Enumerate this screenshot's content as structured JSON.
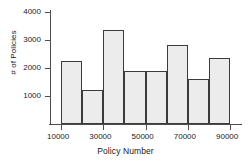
{
  "chart_data": {
    "type": "bar",
    "title": "",
    "xlabel": "Policy Number",
    "ylabel": "# of Policies",
    "categories": [
      "10000-20000",
      "20000-30000",
      "30000-40000",
      "40000-50000",
      "50000-60000",
      "60000-70000",
      "70000-80000",
      "80000-90000"
    ],
    "bin_edges": [
      10000,
      20000,
      30000,
      40000,
      50000,
      60000,
      70000,
      80000,
      90000
    ],
    "values": [
      2250,
      1220,
      3360,
      1880,
      1910,
      2820,
      1610,
      2350
    ],
    "xlim": [
      10000,
      90000
    ],
    "ylim": [
      0,
      4200
    ],
    "xticks": [
      10000,
      30000,
      50000,
      70000,
      90000
    ],
    "xtick_labels": [
      "10000",
      "30000",
      "50000",
      "70000",
      "90000"
    ],
    "yticks": [
      1000,
      2000,
      3000,
      4000
    ],
    "ytick_labels": [
      "1000",
      "2000",
      "3000",
      "4000"
    ],
    "grid": false,
    "legend": null,
    "bar_fill_color": "#ececec",
    "bar_edge_color": "#3b3b3b",
    "axis_color": "#4d4d4d"
  }
}
